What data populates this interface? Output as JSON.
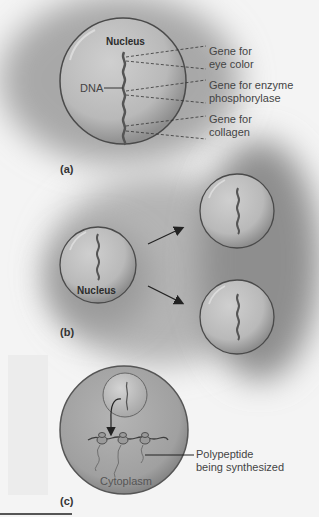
{
  "figure": {
    "panels": [
      {
        "id": "a",
        "label": "(a)",
        "nucleus_label": "Nucleus",
        "dna_label": "DNA",
        "genes": [
          {
            "line1": "Gene for",
            "line2": "eye color"
          },
          {
            "line1": "Gene for enzyme",
            "line2": "phosphorylase"
          },
          {
            "line1": "Gene for",
            "line2": "collagen"
          }
        ]
      },
      {
        "id": "b",
        "label": "(b)",
        "nucleus_label": "Nucleus"
      },
      {
        "id": "c",
        "label": "(c)",
        "polypeptide_label_line1": "Polypeptide",
        "polypeptide_label_line2": "being synthesized",
        "cytoplasm_label": "Cytoplasm"
      }
    ]
  },
  "colors": {
    "background": "#f4f4f4",
    "shadow": "#9a9a9a",
    "cell_fill": "#b5b5b5",
    "cell_stroke": "#4a4a4a",
    "dna": "#555555",
    "text": "#3a3a3a"
  }
}
